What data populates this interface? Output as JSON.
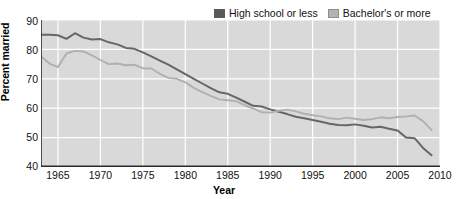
{
  "chart_data": {
    "type": "line",
    "title": "",
    "xlabel": "Year",
    "ylabel": "Percent married",
    "xlim": [
      1963,
      2010
    ],
    "ylim": [
      40,
      90
    ],
    "xticks": [
      1965,
      1970,
      1975,
      1980,
      1985,
      1990,
      1995,
      2000,
      2005,
      2010
    ],
    "yticks": [
      40,
      50,
      60,
      70,
      80,
      90
    ],
    "grid": true,
    "legend_position": "top-right",
    "plot_background": "#d9d9d9",
    "gridline_color": "#ffffff",
    "x": [
      1963,
      1964,
      1965,
      1966,
      1967,
      1968,
      1969,
      1970,
      1971,
      1972,
      1973,
      1974,
      1975,
      1976,
      1977,
      1978,
      1979,
      1980,
      1981,
      1982,
      1983,
      1984,
      1985,
      1986,
      1987,
      1988,
      1989,
      1990,
      1991,
      1992,
      1993,
      1994,
      1995,
      1996,
      1997,
      1998,
      1999,
      2000,
      2001,
      2002,
      2003,
      2004,
      2005,
      2006,
      2007,
      2008,
      2009
    ],
    "series": [
      {
        "name": "High school or less",
        "color": "#666666",
        "values": [
          85.0,
          85.0,
          84.8,
          83.6,
          85.5,
          84.0,
          83.4,
          83.5,
          82.4,
          81.7,
          80.5,
          80.2,
          79.0,
          77.6,
          76.2,
          74.8,
          73.2,
          71.6,
          70.0,
          68.4,
          66.8,
          65.4,
          64.9,
          63.6,
          62.2,
          60.8,
          60.6,
          59.6,
          58.8,
          58.0,
          57.1,
          56.6,
          56.0,
          55.4,
          54.7,
          54.3,
          54.2,
          54.5,
          54.0,
          53.4,
          53.7,
          53.0,
          52.4,
          51.6,
          50.8,
          50.0,
          50.0
        ]
      },
      {
        "name": "Bachelor's or more",
        "color": "#b0b0b0",
        "values": [
          77.6,
          75.2,
          74.0,
          78.6,
          79.5,
          79.3,
          78.0,
          76.4,
          75.0,
          75.2,
          74.6,
          74.8,
          73.6,
          73.5,
          71.7,
          70.3,
          70.0,
          68.8,
          66.9,
          65.5,
          64.2,
          63.0,
          62.7,
          62.4,
          61.0,
          59.9,
          58.6,
          58.5,
          59.1,
          59.5,
          58.9,
          58.1,
          57.6,
          57.2,
          56.6,
          56.3,
          56.8,
          56.4,
          56.0,
          56.3,
          56.9,
          56.6,
          57.0,
          57.1,
          57.6,
          57.2,
          56.8
        ]
      }
    ],
    "series_tail": {
      "note_high_school_drop": [
        2006,
        2007,
        2008,
        2009
      ],
      "high_school_tail_values": [
        50.0,
        49.8,
        46.5,
        44.0
      ],
      "bachelors_tail_values": [
        57.2,
        57.5,
        55.6,
        52.6
      ]
    }
  },
  "legend": {
    "entries": [
      {
        "label": "High school or less",
        "swatch": "dark-swatch-icon"
      },
      {
        "label": "Bachelor's or more",
        "swatch": "light-swatch-icon"
      }
    ]
  },
  "axes": {
    "x_title": "Year",
    "y_title": "Percent married",
    "x_tick_labels": [
      "1965",
      "1970",
      "1975",
      "1980",
      "1985",
      "1990",
      "1995",
      "2000",
      "2005",
      "2010"
    ],
    "y_tick_labels": [
      "90",
      "80",
      "70",
      "60",
      "50",
      "40"
    ]
  }
}
